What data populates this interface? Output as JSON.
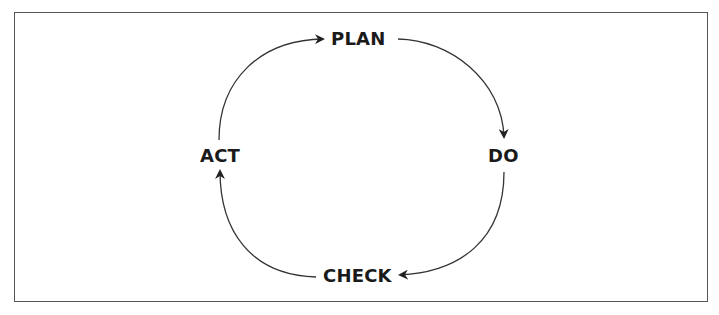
{
  "diagram": {
    "type": "cycle",
    "nodes": [
      {
        "id": "plan",
        "label": "PLAN"
      },
      {
        "id": "do",
        "label": "DO"
      },
      {
        "id": "check",
        "label": "CHECK"
      },
      {
        "id": "act",
        "label": "ACT"
      }
    ],
    "edges": [
      {
        "from": "act",
        "to": "plan"
      },
      {
        "from": "plan",
        "to": "do"
      },
      {
        "from": "do",
        "to": "check"
      },
      {
        "from": "check",
        "to": "act"
      }
    ]
  }
}
